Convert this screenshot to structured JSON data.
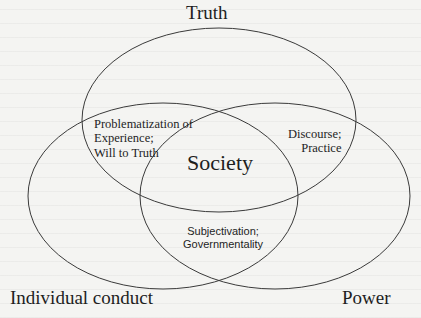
{
  "diagram": {
    "type": "venn",
    "sets": [
      {
        "id": "truth",
        "label": "Truth"
      },
      {
        "id": "individual_conduct",
        "label": "Individual conduct"
      },
      {
        "id": "power",
        "label": "Power"
      }
    ],
    "center": {
      "label": "Society"
    },
    "intersections": {
      "truth_individual": {
        "line1": "Problematization of",
        "line2": "Experience;",
        "line3": "Will to Truth"
      },
      "truth_power": {
        "line1": "Discourse;",
        "line2": "Practice"
      },
      "individual_power": {
        "line1": "Subjectivation;",
        "line2": "Governmentality"
      }
    },
    "colors": {
      "stroke": "#3a3a3a",
      "text": "#1e1e1e",
      "background": "#f4f4f2"
    }
  }
}
